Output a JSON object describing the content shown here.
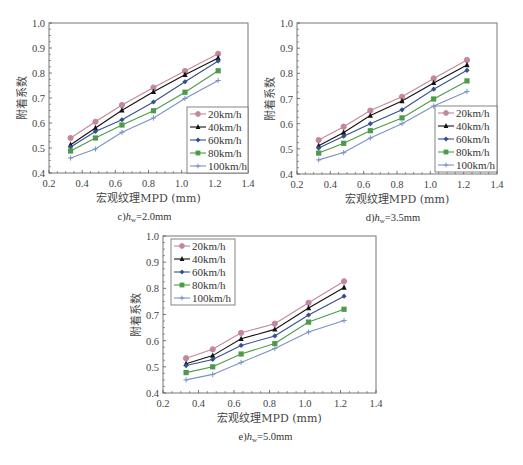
{
  "chart_data": [
    {
      "id": "c",
      "type": "line",
      "caption": {
        "prefix": "c)",
        "var": "h",
        "sub": "w",
        "suffix": "=2.0mm"
      },
      "title": "",
      "xlabel": "宏观纹理MPD (mm)",
      "ylabel": "附着系数",
      "xlim": [
        0.2,
        1.4
      ],
      "ylim": [
        0.4,
        1.0
      ],
      "xticks": [
        "0.2",
        "0.4",
        "0.6",
        "0.8",
        "1.0",
        "1.2",
        "1.4"
      ],
      "yticks": [
        "0.4",
        "0.5",
        "0.6",
        "0.7",
        "0.8",
        "0.9",
        "1.0"
      ],
      "grid": false,
      "legend_position": "lower right",
      "x": [
        0.33,
        0.48,
        0.64,
        0.83,
        1.02,
        1.22
      ],
      "series": [
        {
          "name": "20km/h",
          "values": [
            0.54,
            0.605,
            0.672,
            0.742,
            0.808,
            0.877
          ]
        },
        {
          "name": "40km/h",
          "values": [
            0.513,
            0.58,
            0.651,
            0.725,
            0.793,
            0.86
          ]
        },
        {
          "name": "60km/h",
          "values": [
            0.504,
            0.566,
            0.613,
            0.684,
            0.765,
            0.848
          ]
        },
        {
          "name": "80km/h",
          "values": [
            0.488,
            0.54,
            0.592,
            0.649,
            0.723,
            0.809
          ]
        },
        {
          "name": "100km/h",
          "values": [
            0.46,
            0.496,
            0.563,
            0.62,
            0.698,
            0.77
          ]
        }
      ]
    },
    {
      "id": "d",
      "type": "line",
      "caption": {
        "prefix": "d)",
        "var": "h",
        "sub": "w",
        "suffix": "=3.5mm"
      },
      "title": "",
      "xlabel": "宏观纹理MPD (mm)",
      "ylabel": "附着系数",
      "xlim": [
        0.2,
        1.4
      ],
      "ylim": [
        0.4,
        1.0
      ],
      "xticks": [
        "0.2",
        "0.4",
        "0.6",
        "0.8",
        "1.0",
        "1.2",
        "1.4"
      ],
      "yticks": [
        "0.4",
        "0.5",
        "0.6",
        "0.7",
        "0.8",
        "0.9",
        "1.0"
      ],
      "grid": false,
      "legend_position": "lower right",
      "x": [
        0.33,
        0.48,
        0.64,
        0.83,
        1.02,
        1.22
      ],
      "series": [
        {
          "name": "20km/h",
          "values": [
            0.535,
            0.588,
            0.652,
            0.707,
            0.78,
            0.853
          ]
        },
        {
          "name": "40km/h",
          "values": [
            0.512,
            0.565,
            0.632,
            0.69,
            0.762,
            0.833
          ]
        },
        {
          "name": "60km/h",
          "values": [
            0.503,
            0.55,
            0.6,
            0.655,
            0.737,
            0.812
          ]
        },
        {
          "name": "80km/h",
          "values": [
            0.483,
            0.522,
            0.572,
            0.623,
            0.698,
            0.77
          ]
        },
        {
          "name": "100km/h",
          "values": [
            0.456,
            0.485,
            0.543,
            0.6,
            0.67,
            0.728
          ]
        }
      ]
    },
    {
      "id": "e",
      "type": "line",
      "caption": {
        "prefix": "e)",
        "var": "h",
        "sub": "w",
        "suffix": "=5.0mm"
      },
      "title": "",
      "xlabel": "宏观纹理MPD (mm)",
      "ylabel": "附着系数",
      "xlim": [
        0.2,
        1.4
      ],
      "ylim": [
        0.4,
        1.0
      ],
      "xticks": [
        "0.2",
        "0.4",
        "0.6",
        "0.8",
        "1.0",
        "1.2",
        "1.4"
      ],
      "yticks": [
        "0.4",
        "0.5",
        "0.6",
        "0.7",
        "0.8",
        "0.9",
        "1.0"
      ],
      "grid": false,
      "legend_position": "upper left",
      "x": [
        0.33,
        0.48,
        0.64,
        0.83,
        1.02,
        1.22
      ],
      "series": [
        {
          "name": "20km/h",
          "values": [
            0.533,
            0.567,
            0.63,
            0.665,
            0.745,
            0.827
          ]
        },
        {
          "name": "40km/h",
          "values": [
            0.512,
            0.543,
            0.607,
            0.643,
            0.725,
            0.803
          ]
        },
        {
          "name": "60km/h",
          "values": [
            0.505,
            0.528,
            0.582,
            0.618,
            0.698,
            0.77
          ]
        },
        {
          "name": "80km/h",
          "values": [
            0.478,
            0.5,
            0.549,
            0.589,
            0.671,
            0.72
          ]
        },
        {
          "name": "100km/h",
          "values": [
            0.45,
            0.471,
            0.517,
            0.57,
            0.633,
            0.677
          ]
        }
      ]
    }
  ],
  "series_style": [
    {
      "color": "#c4879a",
      "marker": "circle"
    },
    {
      "color": "#111111",
      "marker": "triangle"
    },
    {
      "color": "#34508e",
      "marker": "diamond"
    },
    {
      "color": "#4c9a4a",
      "marker": "square"
    },
    {
      "color": "#7a92c6",
      "marker": "plus"
    }
  ]
}
